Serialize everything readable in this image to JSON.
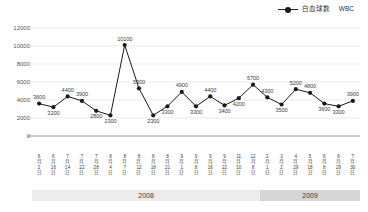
{
  "legend": {
    "marker_icon": "line-dot-marker-icon",
    "label_ja": "白血球数",
    "label_en": "WBC",
    "color": "#1a1a1a"
  },
  "axes": {
    "y_ticks": [
      "0",
      "2000",
      "4000",
      "6000",
      "8000",
      "10000",
      "12000"
    ],
    "y_min": 0,
    "y_max": 12000,
    "y_step": 2000,
    "grid": true
  },
  "year_bands": [
    {
      "label": "2008",
      "start_index": 0,
      "end_index": 15,
      "color": "#ececec"
    },
    {
      "label": "2009",
      "start_index": 16,
      "end_index": 22,
      "color": "#d6d6d6"
    }
  ],
  "chart_data": {
    "type": "line",
    "title": "",
    "subtitle": "",
    "xlabel": "",
    "ylabel": "",
    "ylim": [
      0,
      12000
    ],
    "yticks": [
      0,
      2000,
      4000,
      6000,
      8000,
      10000,
      12000
    ],
    "grid": true,
    "legend_position": "top-right",
    "marker": "circle",
    "line_color": "#1a1a1a",
    "categories": [
      "6月2日",
      "6月16日",
      "7月14日",
      "7月22日",
      "7月28日",
      "8月4日",
      "8月7日",
      "8月12日",
      "8月18日",
      "8月21日",
      "9月1日",
      "9月8日",
      "9月16日",
      "9月22日",
      "11月10日",
      "12月8日",
      "2月1日",
      "3月2日",
      "4月29日",
      "5月18日",
      "6月8日",
      "6月29日",
      "7月30日"
    ],
    "category_parts": [
      {
        "month": "6",
        "month_kanji": "月",
        "day": "2",
        "day_kanji": "日"
      },
      {
        "month": "6",
        "month_kanji": "月",
        "day": "16",
        "day_kanji": "日"
      },
      {
        "month": "7",
        "month_kanji": "月",
        "day": "14",
        "day_kanji": "日"
      },
      {
        "month": "7",
        "month_kanji": "月",
        "day": "22",
        "day_kanji": "日"
      },
      {
        "month": "7",
        "month_kanji": "月",
        "day": "28",
        "day_kanji": "日"
      },
      {
        "month": "8",
        "month_kanji": "月",
        "day": "4",
        "day_kanji": "日"
      },
      {
        "month": "8",
        "month_kanji": "月",
        "day": "7",
        "day_kanji": "日"
      },
      {
        "month": "8",
        "month_kanji": "月",
        "day": "12",
        "day_kanji": "日"
      },
      {
        "month": "8",
        "month_kanji": "月",
        "day": "18",
        "day_kanji": "日"
      },
      {
        "month": "8",
        "month_kanji": "月",
        "day": "21",
        "day_kanji": "日"
      },
      {
        "month": "9",
        "month_kanji": "月",
        "day": "1",
        "day_kanji": "日"
      },
      {
        "month": "9",
        "month_kanji": "月",
        "day": "8",
        "day_kanji": "日"
      },
      {
        "month": "9",
        "month_kanji": "月",
        "day": "16",
        "day_kanji": "日"
      },
      {
        "month": "9",
        "month_kanji": "月",
        "day": "22",
        "day_kanji": "日"
      },
      {
        "month": "11",
        "month_kanji": "月",
        "day": "10",
        "day_kanji": "日"
      },
      {
        "month": "12",
        "month_kanji": "月",
        "day": "8",
        "day_kanji": "日"
      },
      {
        "month": "2",
        "month_kanji": "月",
        "day": "1",
        "day_kanji": "日"
      },
      {
        "month": "3",
        "month_kanji": "月",
        "day": "2",
        "day_kanji": "日"
      },
      {
        "month": "4",
        "month_kanji": "月",
        "day": "29",
        "day_kanji": "日"
      },
      {
        "month": "5",
        "month_kanji": "月",
        "day": "18",
        "day_kanji": "日"
      },
      {
        "month": "6",
        "month_kanji": "月",
        "day": "8",
        "day_kanji": "日"
      },
      {
        "month": "6",
        "month_kanji": "月",
        "day": "29",
        "day_kanji": "日"
      },
      {
        "month": "7",
        "month_kanji": "月",
        "day": "30",
        "day_kanji": "日"
      }
    ],
    "series": [
      {
        "name": "白血球数　WBC",
        "values": [
          3600,
          3200,
          4400,
          3900,
          2800,
          2300,
          10100,
          5300,
          2300,
          3300,
          4900,
          3300,
          4400,
          3400,
          4200,
          5700,
          4300,
          3500,
          5200,
          4800,
          3600,
          3300,
          3900
        ],
        "label_positions": [
          "above",
          "below",
          "above",
          "above",
          "below",
          "below",
          "above",
          "above",
          "below",
          "below",
          "above",
          "below",
          "above",
          "below",
          "below",
          "above",
          "above",
          "below",
          "above",
          "above",
          "below",
          "below",
          "above"
        ]
      }
    ]
  }
}
